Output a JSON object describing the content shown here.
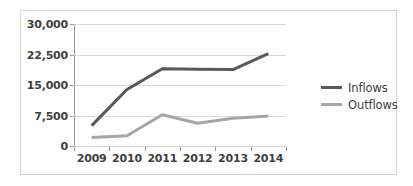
{
  "chart_data": {
    "type": "line",
    "title": "",
    "xlabel": "",
    "ylabel": "",
    "categories": [
      "2009",
      "2010",
      "2011",
      "2012",
      "2013",
      "2014"
    ],
    "series": [
      {
        "name": "Inflows",
        "color": "#595959",
        "values": [
          5000,
          13900,
          19000,
          18900,
          18800,
          22700
        ]
      },
      {
        "name": "Outflows",
        "color": "#a6a6a6",
        "values": [
          2100,
          2500,
          7700,
          5600,
          6800,
          7400
        ]
      }
    ],
    "ylim": [
      0,
      30000
    ],
    "yticks": [
      0,
      7500,
      15000,
      22500,
      30000
    ],
    "ytick_labels": [
      "0",
      "7,500",
      "15,000",
      "22,500",
      "30,000"
    ],
    "grid": true,
    "legend_position": "right"
  },
  "legend": {
    "items": [
      {
        "label": "Inflows",
        "color": "#595959"
      },
      {
        "label": "Outflows",
        "color": "#a6a6a6"
      }
    ]
  }
}
